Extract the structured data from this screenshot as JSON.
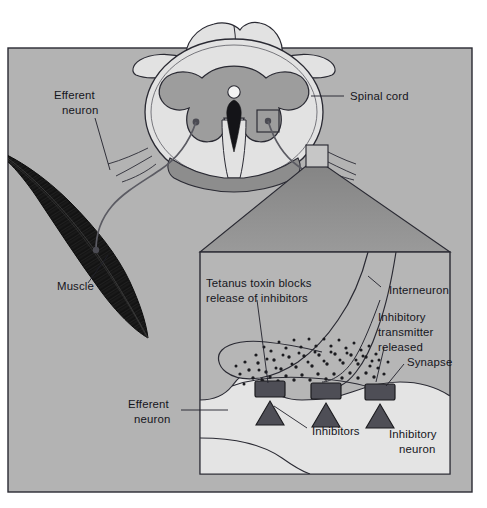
{
  "figure": {
    "type": "biomedical-diagram"
  },
  "palette": {
    "page_background": "#ffffff",
    "panel_background": "#b3b3b3",
    "inset_background": "#b6b6b6",
    "zoom_cone": "#8e8e8e",
    "white_matter": "#e2e2e2",
    "gray_matter": "#9d9d9d",
    "neuron_body": "#e4e4e4",
    "muscle": "#131313",
    "marker_dark": "#4a4a4a",
    "outline": "#2a2a33",
    "text": "#15151c"
  },
  "labels": {
    "efferent_neuron_top": {
      "line1": "Efferent",
      "line2": "neuron"
    },
    "spinal_cord": {
      "text": "Spinal cord"
    },
    "muscle": {
      "text": "Muscle"
    },
    "efferent_neuron_inset": {
      "line1": "Efferent",
      "line2": "neuron"
    },
    "tetanus_toxin": {
      "line1": "Tetanus toxin blocks",
      "line2": "release of inhibitors"
    },
    "interneuron": {
      "text": "Interneuron"
    },
    "inhibitory_transmitter": {
      "line1": "Inhibitory",
      "line2": "transmitter",
      "line3": "released"
    },
    "synapse": {
      "text": "Synapse"
    },
    "inhibitors": {
      "text": "Inhibitors"
    },
    "inhibitory_neuron": {
      "line1": "Inhibitory",
      "line2": "neuron"
    }
  },
  "structures": {
    "spinal_cord_section": "transverse section of spinal cord with butterfly-shaped gray matter, central canal and surrounding white matter",
    "magnifier_square": "small square on right dorsal gray matter marking the magnified region",
    "zoom_cone": "trapezoid linking magnifier square to detail inset box",
    "inset_counts": {
      "receptor_blocks": 3,
      "inhibitor_triangles": 3,
      "transmitter_vesicle_dots": 74
    }
  }
}
